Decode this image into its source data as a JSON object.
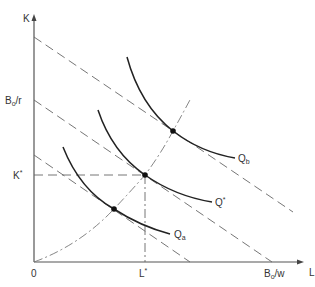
{
  "diagram": {
    "axes": {
      "y_label": "K",
      "x_label": "L",
      "origin_label": "0"
    },
    "y_ticks": {
      "budget_intercept": {
        "main": "B",
        "sub": "o",
        "rest": "/r"
      },
      "k_star": {
        "main": "K",
        "sup": "*"
      }
    },
    "x_ticks": {
      "budget_intercept": {
        "main": "B",
        "sub": "o",
        "rest": "/w"
      },
      "l_star": {
        "main": "L",
        "sup": "*"
      }
    },
    "isoquants": [
      {
        "id": "qa",
        "main": "Q",
        "sub": "a"
      },
      {
        "id": "qstar",
        "main": "Q",
        "sup": "*"
      },
      {
        "id": "qb",
        "main": "Q",
        "sub": "b"
      }
    ],
    "colors": {
      "isoquant": "#222222",
      "budget_line": "#666666",
      "axis": "#555555",
      "text": "#333333"
    }
  }
}
